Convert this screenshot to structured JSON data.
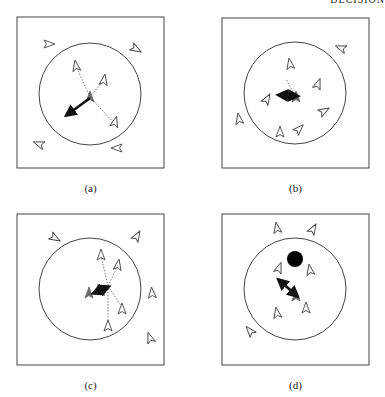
{
  "header": {
    "text": "DECISION"
  },
  "colors": {
    "stroke": "#444444",
    "focal": "#6a6a6a",
    "arrow": "#111111",
    "neighbor_line": "#555555",
    "obstacle": "#000000"
  },
  "panels": [
    {
      "id": "a",
      "caption": "(a)",
      "box": [
        17,
        17,
        147,
        151
      ],
      "circle": {
        "cx": 90,
        "cy": 94,
        "r": 51
      },
      "focal": {
        "x": 90,
        "y": 97,
        "angle": -90
      },
      "arrow": {
        "x1": 90,
        "y1": 98,
        "x2": 67,
        "y2": 115,
        "double": false
      },
      "links": [
        [
          90,
          97,
          76,
          66
        ],
        [
          90,
          97,
          104,
          80
        ],
        [
          90,
          97,
          115,
          124
        ]
      ],
      "agents": [
        {
          "x": 49,
          "y": 44,
          "a": 0
        },
        {
          "x": 136,
          "y": 49,
          "a": 30
        },
        {
          "x": 76,
          "y": 66,
          "a": -100
        },
        {
          "x": 104,
          "y": 80,
          "a": -80
        },
        {
          "x": 115,
          "y": 122,
          "a": -75
        },
        {
          "x": 39,
          "y": 144,
          "a": 200
        },
        {
          "x": 117,
          "y": 148,
          "a": 180
        }
      ],
      "obstacle": null
    },
    {
      "id": "b",
      "caption": "(b)",
      "box": [
        222,
        18,
        147,
        150
      ],
      "circle": {
        "cx": 295,
        "cy": 93,
        "r": 51
      },
      "focal": {
        "x": 296,
        "y": 97,
        "angle": -90
      },
      "arrow": {
        "x1": 297,
        "y1": 96,
        "x2": 279,
        "y2": 95,
        "double": true
      },
      "links": [
        [
          296,
          97,
          286,
          79
        ]
      ],
      "agents": [
        {
          "x": 341,
          "y": 48,
          "a": 200
        },
        {
          "x": 290,
          "y": 64,
          "a": -100
        },
        {
          "x": 318,
          "y": 84,
          "a": -70
        },
        {
          "x": 267,
          "y": 99,
          "a": -60
        },
        {
          "x": 324,
          "y": 111,
          "a": -30
        },
        {
          "x": 239,
          "y": 119,
          "a": -100
        },
        {
          "x": 280,
          "y": 132,
          "a": -90
        },
        {
          "x": 299,
          "y": 129,
          "a": -45
        }
      ],
      "obstacle": null
    },
    {
      "id": "c",
      "caption": "(c)",
      "box": [
        17,
        214,
        147,
        151
      ],
      "circle": {
        "cx": 90,
        "cy": 289,
        "r": 51
      },
      "focal": {
        "x": 89,
        "y": 293,
        "angle": -90
      },
      "arrow": {
        "x1": 94,
        "y1": 293,
        "x2": 108,
        "y2": 287,
        "double": true
      },
      "links": [
        [
          108,
          286,
          101,
          256
        ],
        [
          108,
          286,
          118,
          265
        ],
        [
          108,
          286,
          122,
          307
        ],
        [
          108,
          286,
          108,
          323
        ]
      ],
      "agents": [
        {
          "x": 55,
          "y": 238,
          "a": 30
        },
        {
          "x": 137,
          "y": 236,
          "a": -60
        },
        {
          "x": 101,
          "y": 255,
          "a": -90
        },
        {
          "x": 118,
          "y": 265,
          "a": -80
        },
        {
          "x": 152,
          "y": 293,
          "a": -95
        },
        {
          "x": 122,
          "y": 309,
          "a": -90
        },
        {
          "x": 108,
          "y": 326,
          "a": -90
        },
        {
          "x": 150,
          "y": 338,
          "a": -110
        }
      ],
      "obstacle": null
    },
    {
      "id": "d",
      "caption": "(d)",
      "box": [
        222,
        214,
        147,
        151
      ],
      "circle": {
        "cx": 295,
        "cy": 289,
        "r": 51
      },
      "focal": {
        "x": 296,
        "y": 296,
        "angle": -90
      },
      "arrow": {
        "x1": 297,
        "y1": 296,
        "x2": 279,
        "y2": 280,
        "double": true
      },
      "links": [],
      "agents": [
        {
          "x": 277,
          "y": 228,
          "a": -100
        },
        {
          "x": 313,
          "y": 229,
          "a": -60
        },
        {
          "x": 279,
          "y": 268,
          "a": -70
        },
        {
          "x": 310,
          "y": 270,
          "a": -100
        },
        {
          "x": 306,
          "y": 308,
          "a": -90
        },
        {
          "x": 277,
          "y": 313,
          "a": -100
        },
        {
          "x": 250,
          "y": 331,
          "a": -130
        }
      ],
      "obstacle": {
        "cx": 295,
        "cy": 259,
        "r": 8
      }
    }
  ]
}
